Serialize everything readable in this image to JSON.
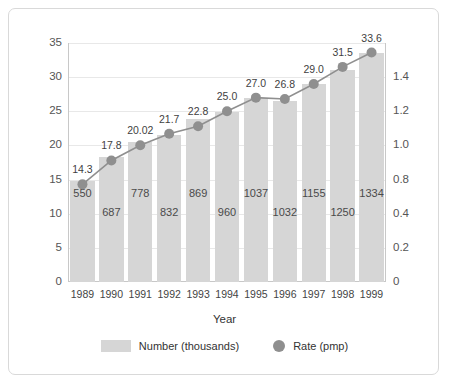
{
  "chart_data": {
    "type": "bar",
    "title": "",
    "xlabel": "Year",
    "ylabel": "",
    "categories": [
      "1989",
      "1990",
      "1991",
      "1992",
      "1993",
      "1994",
      "1995",
      "1996",
      "1997",
      "1998",
      "1999"
    ],
    "series": [
      {
        "name": "Number (thousands)",
        "type": "bar",
        "axis": "left",
        "color": "#d6d6d6",
        "values": [
          550,
          687,
          778,
          832,
          869,
          960,
          1037,
          1032,
          1155,
          1250,
          1334
        ],
        "plotted_values": [
          14.8,
          18.3,
          20.5,
          21.6,
          23.8,
          24.9,
          26.9,
          26.5,
          29.0,
          31.0,
          33.5
        ]
      },
      {
        "name": "Rate (pmp)",
        "type": "line",
        "axis": "right",
        "color": "#8f8f8f",
        "values": [
          14.3,
          17.8,
          20.02,
          21.7,
          22.8,
          25.0,
          27.0,
          26.8,
          29.0,
          31.5,
          33.6
        ],
        "labels": [
          "14.3",
          "17.8",
          "20.02",
          "21.7",
          "22.8",
          "25.0",
          "27.0",
          "26.8",
          "29.0",
          "31.5",
          "33.6"
        ]
      }
    ],
    "left_axis": {
      "ticks": [
        "0",
        "5",
        "10",
        "15",
        "20",
        "25",
        "30",
        "35"
      ],
      "values": [
        0,
        5,
        10,
        15,
        20,
        25,
        30,
        35
      ],
      "ylim": [
        0,
        35
      ]
    },
    "right_axis": {
      "ticks": [
        "0",
        "0.2",
        "0.4",
        "0.8",
        "1.0",
        "1.2",
        "1.4"
      ],
      "values": [
        0,
        5,
        10,
        15,
        20,
        25,
        30
      ],
      "ylim": [
        0,
        35
      ]
    },
    "grid": true,
    "legend_position": "bottom"
  },
  "legend": {
    "bar_label": "Number (thousands)",
    "line_label": "Rate (pmp)"
  },
  "axis_titles": {
    "x": "Year"
  }
}
